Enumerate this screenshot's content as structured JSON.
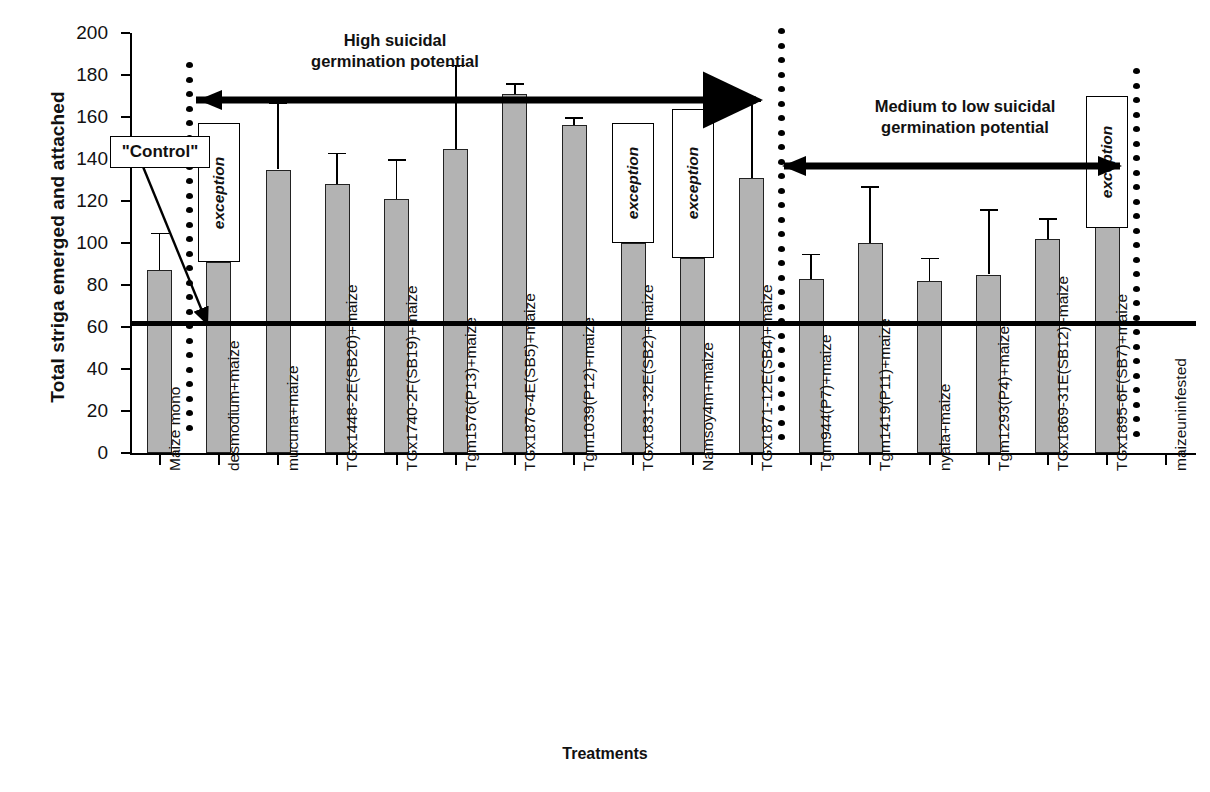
{
  "chart_data": {
    "type": "bar",
    "title": "",
    "xlabel": "Treatments",
    "ylabel": "Total striga emerged and attached",
    "ylim": [
      0,
      200
    ],
    "ytick_values": [
      0,
      20,
      40,
      60,
      80,
      100,
      120,
      140,
      160,
      180,
      200
    ],
    "ytick_labels": [
      "0",
      "20",
      "40",
      "60",
      "80",
      "100",
      "120",
      "140",
      "160",
      "180",
      "200"
    ],
    "grid": false,
    "legend": "none",
    "categories": [
      "Maize mono",
      "desmodium+maize",
      "mucuna+maize",
      "TGx1448-2E(SB20)+maize",
      "TGx1740-2F(SB19)+maize",
      "Tgm1576(P13)+maize",
      "TGx1876-4E(SB5)+maize",
      "Tgm1039(P12)+maize",
      "TGx1831-32E(SB2)+maize",
      "Namsoy4m+maize",
      "TGx1871-12E(SB4)+maize",
      "Tgm944(P7)+maize",
      "Tgm1419(P11)+maize",
      "nyala+maize",
      "Tgm1293(P4)+maize",
      "TGx1869-31E(SB12)+maize",
      "TGx1895-6F(SB7)+maize",
      "maizeuninfested"
    ],
    "values": [
      87,
      91,
      135,
      128,
      121,
      145,
      171,
      156,
      100,
      93,
      131,
      83,
      100,
      82,
      85,
      102,
      131,
      0
    ],
    "error_upper": [
      105,
      121,
      167,
      143,
      140,
      185,
      176,
      160,
      130,
      122,
      168,
      95,
      127,
      93,
      116,
      112,
      137,
      0
    ],
    "bar_fill_color": "#b3b3b3",
    "bar_edge_color": "#222222",
    "threshold_line": {
      "value": 62,
      "color": "#000000",
      "label": ""
    },
    "annotations": [
      {
        "name": "control-callout",
        "text": "\"Control\"",
        "points_to_category": "Maize mono"
      },
      {
        "name": "region-high",
        "text": "High suicidal\ngermination potential"
      },
      {
        "name": "region-medium-low",
        "text": "Medium to low suicidal\ngermination potential"
      },
      {
        "name": "exception-1",
        "text": "exception",
        "category": "desmodium+maize"
      },
      {
        "name": "exception-2",
        "text": "exception",
        "category": "TGx1831-32E(SB2)+maize"
      },
      {
        "name": "exception-3",
        "text": "exception",
        "category": "Namsoy4m+maize"
      },
      {
        "name": "exception-4",
        "text": "exception",
        "category": "TGx1895-6F(SB7)+maize"
      }
    ],
    "separators": [
      {
        "name": "dotted-separator-left",
        "after_category": "Maize mono"
      },
      {
        "name": "dotted-separator-middle",
        "after_category": "TGx1871-12E(SB4)+maize"
      },
      {
        "name": "dotted-separator-right",
        "after_category": "TGx1895-6F(SB7)+maize"
      }
    ]
  },
  "axes": {
    "y_title": "Total striga emerged and attached",
    "x_title": "Treatments"
  },
  "labels": {
    "control": "\"Control\"",
    "exception": "exception",
    "region_high": "High suicidal\ngermination potential",
    "region_medium_low": "Medium to low suicidal\ngermination potential"
  }
}
